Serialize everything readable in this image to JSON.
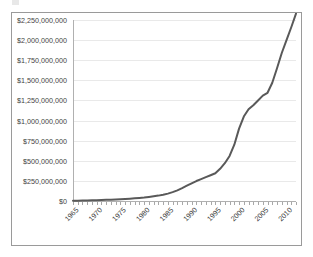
{
  "chart_data": {
    "type": "line",
    "title": "",
    "subtitle": "",
    "xlabel": "",
    "ylabel": "",
    "grid": true,
    "legend": false,
    "legend_position": "none",
    "line_color": "#595959",
    "plot_background": "#ffffff",
    "gridline_color": "#e9e9e9",
    "border_color": "#9a9a9a",
    "xlim": [
      1965,
      2012
    ],
    "ylim": [
      0,
      2250000000
    ],
    "y_tick_interval": 250000000,
    "x_tick_interval_minor": 1,
    "x_tick_interval_major": 5,
    "x_label_rotation": -45,
    "ytick_labels": [
      "$0",
      "$250,000,000",
      "$500,000,000",
      "$750,000,000",
      "$1,000,000,000",
      "$1,250,000,000",
      "$1,500,000,000",
      "$1,750,000,000",
      "$2,000,000,000",
      "$2,250,000,000"
    ],
    "ytick_values": [
      0,
      250000000,
      500000000,
      750000000,
      1000000000,
      1250000000,
      1500000000,
      1750000000,
      2000000000,
      2250000000
    ],
    "xtick_labels": [
      "1965",
      "1970",
      "1975",
      "1980",
      "1985",
      "1990",
      "1995",
      "2000",
      "2005",
      "2010"
    ],
    "xtick_values": [
      1965,
      1970,
      1975,
      1980,
      1985,
      1990,
      1995,
      2000,
      2005,
      2010
    ],
    "series": [
      {
        "name": "Cumulative Total",
        "color": "#595959",
        "x": [
          1965,
          1966,
          1967,
          1968,
          1969,
          1970,
          1971,
          1972,
          1973,
          1974,
          1975,
          1976,
          1977,
          1978,
          1979,
          1980,
          1981,
          1982,
          1983,
          1984,
          1985,
          1986,
          1987,
          1988,
          1989,
          1990,
          1991,
          1992,
          1993,
          1994,
          1995,
          1996,
          1997,
          1998,
          1999,
          2000,
          2001,
          2002,
          2003,
          2004,
          2005,
          2006,
          2007,
          2008,
          2009,
          2010,
          2011,
          2012
        ],
        "values": [
          3000000,
          4000000,
          5000000,
          6500000,
          8000000,
          10000000,
          12000000,
          14000000,
          16000000,
          19000000,
          22000000,
          25000000,
          29000000,
          33000000,
          38000000,
          43000000,
          50000000,
          58000000,
          67000000,
          78000000,
          92000000,
          110000000,
          132000000,
          160000000,
          190000000,
          220000000,
          248000000,
          272000000,
          296000000,
          320000000,
          345000000,
          400000000,
          470000000,
          560000000,
          700000000,
          900000000,
          1050000000,
          1140000000,
          1190000000,
          1250000000,
          1310000000,
          1345000000,
          1470000000,
          1650000000,
          1840000000,
          2000000000,
          2160000000,
          2330000000
        ]
      }
    ]
  }
}
